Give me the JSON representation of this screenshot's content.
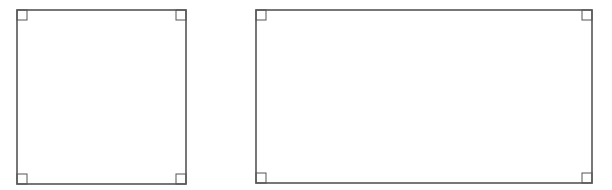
{
  "diagram": {
    "stroke_color": "#555555",
    "shapes": [
      {
        "name": "square",
        "x": 17,
        "y": 10,
        "width": 169,
        "height": 174,
        "right_angle_marks": 4,
        "mark_size": 10
      },
      {
        "name": "rectangle",
        "x": 256,
        "y": 10,
        "width": 336,
        "height": 173,
        "right_angle_marks": 4,
        "mark_size": 10
      }
    ]
  }
}
